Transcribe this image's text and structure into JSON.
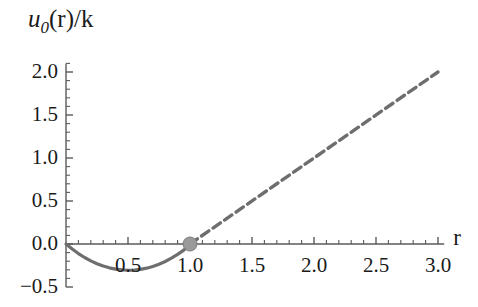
{
  "chart_data": {
    "type": "line",
    "title": "",
    "subtitle": "",
    "xlabel": "r",
    "ylabel": "u_0(r)/k",
    "ylabel_parts": {
      "main": "u",
      "subscript": "0",
      "rest": "(r)/k"
    },
    "xlim": [
      0.0,
      3.05
    ],
    "ylim": [
      -0.5,
      2.1
    ],
    "grid": false,
    "legend": null,
    "axis_origin": [
      0.0,
      0.0
    ],
    "xticks": [
      0.5,
      1.0,
      1.5,
      2.0,
      2.5,
      3.0
    ],
    "xticklabels": [
      "0.5",
      "1.0",
      "1.5",
      "2.0",
      "2.5",
      "3.0"
    ],
    "yticks": [
      -0.5,
      0.0,
      0.5,
      1.0,
      1.5,
      2.0
    ],
    "yticklabels": [
      "−0.5",
      "0.0",
      "0.5",
      "1.0",
      "1.5",
      "2.0"
    ],
    "minor_ticks_between": 4,
    "series": [
      {
        "name": "u_0 well (solid)",
        "style": "solid",
        "color": "#6e6e6e",
        "width": 3.2,
        "x": [
          0.0,
          0.05,
          0.1,
          0.15,
          0.2,
          0.25,
          0.3,
          0.35,
          0.4,
          0.45,
          0.5,
          0.55,
          0.6,
          0.65,
          0.7,
          0.75,
          0.8,
          0.85,
          0.9,
          0.95,
          1.0
        ],
        "y": [
          0.0,
          -0.059,
          -0.111,
          -0.157,
          -0.196,
          -0.229,
          -0.256,
          -0.277,
          -0.292,
          -0.301,
          -0.305,
          -0.303,
          -0.295,
          -0.281,
          -0.261,
          -0.235,
          -0.203,
          -0.165,
          -0.121,
          -0.071,
          0.0
        ]
      },
      {
        "name": "linear asymptote (dashed)",
        "style": "dashed",
        "color": "#6e6e6e",
        "width": 3.4,
        "dash": [
          9,
          5
        ],
        "x": [
          1.0,
          3.0
        ],
        "y": [
          0.0,
          2.0
        ]
      }
    ],
    "markers": [
      {
        "name": "contact-point",
        "x": 1.0,
        "y": 0.0,
        "shape": "circle",
        "radius": 7,
        "fill": "#9a9a9a",
        "edge": "#7d7d7d"
      }
    ],
    "colors": {
      "curve": "#6e6e6e",
      "axis": "#5a5a5a",
      "text": "#1a1a1a",
      "marker": "#9a9a9a",
      "background": "#ffffff"
    }
  }
}
